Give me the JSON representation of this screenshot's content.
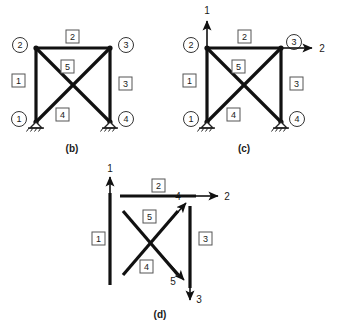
{
  "figure": {
    "background_color": "#ffffff",
    "line_color": "#111111"
  },
  "panels": [
    {
      "id": "b",
      "caption": "(b)",
      "description": "Truss with node numbers and member numbers",
      "nodes": [
        {
          "label": "1",
          "position": "bottom-left",
          "support": "pinned"
        },
        {
          "label": "2",
          "position": "top-left",
          "support": "none"
        },
        {
          "label": "3",
          "position": "top-right",
          "support": "none"
        },
        {
          "label": "4",
          "position": "bottom-right",
          "support": "pinned"
        }
      ],
      "members": [
        {
          "label": "1",
          "from": "1",
          "to": "2",
          "orientation": "vertical-left"
        },
        {
          "label": "2",
          "from": "2",
          "to": "3",
          "orientation": "horizontal-top"
        },
        {
          "label": "3",
          "from": "3",
          "to": "4",
          "orientation": "vertical-right"
        },
        {
          "label": "4",
          "from": "1",
          "to": "3",
          "orientation": "diagonal-up-right"
        },
        {
          "label": "5",
          "from": "2",
          "to": "4",
          "orientation": "diagonal-down-right"
        }
      ],
      "forces": []
    },
    {
      "id": "c",
      "caption": "(c)",
      "description": "Truss with global degrees of freedom indicated",
      "nodes": [
        {
          "label": "1",
          "position": "bottom-left",
          "support": "pinned"
        },
        {
          "label": "2",
          "position": "top-left",
          "support": "none"
        },
        {
          "label": "3",
          "position": "top-right",
          "support": "none"
        },
        {
          "label": "4",
          "position": "bottom-right",
          "support": "pinned"
        }
      ],
      "members": [
        {
          "label": "1",
          "from": "1",
          "to": "2",
          "orientation": "vertical-left"
        },
        {
          "label": "2",
          "from": "2",
          "to": "3",
          "orientation": "horizontal-top"
        },
        {
          "label": "3",
          "from": "3",
          "to": "4",
          "orientation": "vertical-right"
        },
        {
          "label": "4",
          "from": "1",
          "to": "3",
          "orientation": "diagonal-up-right"
        },
        {
          "label": "5",
          "from": "2",
          "to": "4",
          "orientation": "diagonal-down-right"
        }
      ],
      "forces": [
        {
          "label": "1",
          "at_node": "2",
          "direction": "up"
        },
        {
          "label": "2",
          "at_node": "3",
          "direction": "right"
        }
      ]
    },
    {
      "id": "d",
      "caption": "(d)",
      "description": "Exploded members with local degrees of freedom",
      "nodes": [],
      "members": [
        {
          "label": "1",
          "orientation": "vertical-left"
        },
        {
          "label": "2",
          "orientation": "horizontal-top"
        },
        {
          "label": "3",
          "orientation": "vertical-right"
        },
        {
          "label": "4",
          "orientation": "diagonal-up-right"
        },
        {
          "label": "5",
          "orientation": "diagonal-down-right"
        }
      ],
      "forces": [
        {
          "label": "1",
          "direction": "up",
          "on_member": "1"
        },
        {
          "label": "2",
          "direction": "right",
          "on_member": "2"
        },
        {
          "label": "3",
          "direction": "down",
          "on_member": "3"
        },
        {
          "label": "4",
          "direction": "up-right",
          "on_member": "4"
        },
        {
          "label": "5",
          "direction": "down-right",
          "on_member": "5"
        }
      ]
    }
  ]
}
